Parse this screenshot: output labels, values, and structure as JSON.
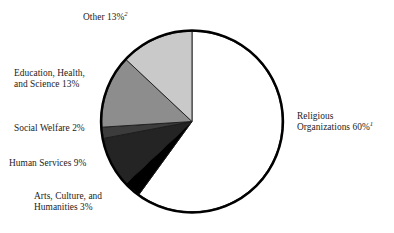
{
  "chart_data": {
    "type": "pie",
    "title": "",
    "subtitle": "",
    "xlabel": "",
    "ylabel": "",
    "legend_position": "none",
    "grid": false,
    "units": "percent",
    "total": 100,
    "start_angle_deg": 0,
    "direction": "clockwise",
    "categories": [
      "Religious Organizations",
      "Arts, Culture, and Humanities",
      "Human Services",
      "Social Welfare",
      "Education, Health, and Science",
      "Other"
    ],
    "values": [
      60,
      3,
      9,
      2,
      13,
      13
    ],
    "slices": [
      {
        "name": "Religious Organizations",
        "value": 60,
        "value_text": "60%",
        "footnote_marker": "1",
        "color": "#ffffff",
        "label_line1": "Religious",
        "label_line2": "Organizations 60%"
      },
      {
        "name": "Arts, Culture, and Humanities",
        "value": 3,
        "value_text": "3%",
        "footnote_marker": "",
        "color": "#000000",
        "label_line1": "Arts, Culture, and",
        "label_line2": "Humanities 3%"
      },
      {
        "name": "Human Services",
        "value": 9,
        "value_text": "9%",
        "footnote_marker": "",
        "color": "#242424",
        "label_line1": "Human Services 9%",
        "label_line2": ""
      },
      {
        "name": "Social Welfare",
        "value": 2,
        "value_text": "2%",
        "footnote_marker": "",
        "color": "#3c3c3c",
        "label_line1": "Social Welfare 2%",
        "label_line2": ""
      },
      {
        "name": "Education, Health, and Science",
        "value": 13,
        "value_text": "13%",
        "footnote_marker": "",
        "color": "#8d8d8d",
        "label_line1": "Education, Health,",
        "label_line2": "and Science 13%"
      },
      {
        "name": "Other",
        "value": 13,
        "value_text": "13%",
        "footnote_marker": "2",
        "color": "#c9c9c9",
        "label_line1": "Other 13%",
        "label_line2": ""
      }
    ],
    "outline_color": "#000000"
  },
  "labels": {
    "other": "Other 13%",
    "other_sup": "2",
    "education_l1": "Education, Health,",
    "education_l2": "and Science 13%",
    "social_welfare": "Social Welfare 2%",
    "human_services": "Human Services 9%",
    "arts_l1": "Arts, Culture, and",
    "arts_l2": "Humanities 3%",
    "religious_l1": "Religious",
    "religious_l2": "Organizations 60%",
    "religious_sup": "1"
  }
}
